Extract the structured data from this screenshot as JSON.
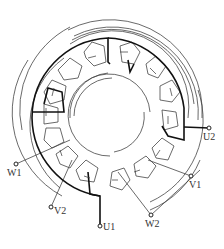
{
  "diagram": {
    "type": "three-phase stator winding diagram",
    "terminals": [
      {
        "id": "W1",
        "label": "W1",
        "x": 16,
        "y": 164,
        "lx": 7,
        "ly": 170
      },
      {
        "id": "U2",
        "label": "U2",
        "x": 209,
        "y": 128,
        "lx": 203,
        "ly": 133
      },
      {
        "id": "V1",
        "label": "V1",
        "x": 191,
        "y": 176,
        "lx": 190,
        "ly": 181
      },
      {
        "id": "V2",
        "label": "V2",
        "x": 51,
        "y": 207,
        "lx": 54,
        "ly": 208
      },
      {
        "id": "U1",
        "label": "U1",
        "x": 100,
        "y": 226,
        "lx": 103,
        "ly": 223
      },
      {
        "id": "W2",
        "label": "W2",
        "x": 151,
        "y": 215,
        "lx": 145,
        "ly": 221
      }
    ],
    "colors": {
      "line": "#333333",
      "bold": "#111111",
      "background": "#ffffff"
    }
  }
}
